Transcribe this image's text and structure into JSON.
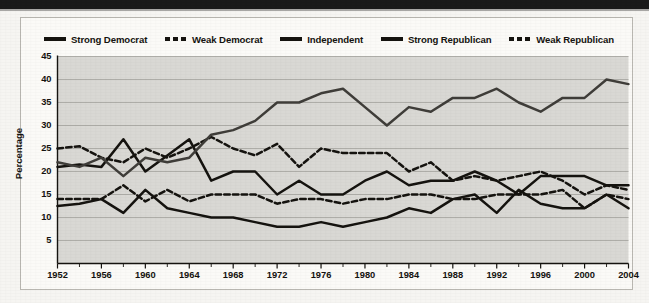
{
  "figure": {
    "y_axis_title": "Percentage"
  },
  "legend": {
    "items": [
      {
        "label": "Strong Democrat",
        "style": "solid",
        "color": "#15130f"
      },
      {
        "label": "Weak Democrat",
        "style": "dashed",
        "color": "#15130f"
      },
      {
        "label": "Independent",
        "style": "solid",
        "color": "#15130f"
      },
      {
        "label": "Strong Republican",
        "style": "solid",
        "color": "#15130f"
      },
      {
        "label": "Weak Republican",
        "style": "dashed",
        "color": "#15130f"
      }
    ]
  },
  "axes": {
    "y_ticks": [
      "45",
      "40",
      "35",
      "30",
      "25",
      "20",
      "15",
      "10",
      "5"
    ],
    "x_ticks": [
      "1952",
      "1956",
      "1960",
      "1964",
      "1968",
      "1972",
      "1976",
      "1980",
      "1984",
      "1988",
      "1992",
      "1996",
      "2000",
      "2004"
    ]
  },
  "chart_data": {
    "type": "line",
    "title": "",
    "xlabel": "",
    "ylabel": "Percentage",
    "xlim": [
      1952,
      2004
    ],
    "ylim": [
      0,
      45
    ],
    "yticks": [
      5,
      10,
      15,
      20,
      25,
      30,
      35,
      40,
      45
    ],
    "xticks": [
      1952,
      1956,
      1960,
      1964,
      1968,
      1972,
      1976,
      1980,
      1984,
      1988,
      1992,
      1996,
      2000,
      2004
    ],
    "x_minor_tick_step": 2,
    "grid": "horizontal",
    "legend_position": "top",
    "plot_background": "#d9d8d4",
    "x": [
      1952,
      1954,
      1956,
      1958,
      1960,
      1962,
      1964,
      1966,
      1968,
      1970,
      1972,
      1974,
      1976,
      1978,
      1980,
      1982,
      1984,
      1986,
      1988,
      1990,
      1992,
      1994,
      1996,
      1998,
      2000,
      2002,
      2004
    ],
    "series": [
      {
        "name": "Strong Democrat",
        "style": "solid",
        "color": "#15130f",
        "values": [
          21,
          21.5,
          21,
          27,
          20,
          23.5,
          27,
          18,
          20,
          20,
          15,
          18,
          15,
          15,
          18,
          20,
          17,
          18,
          18,
          20,
          18,
          15,
          19,
          19,
          19,
          17,
          17
        ]
      },
      {
        "name": "Weak Democrat",
        "style": "dashed",
        "color": "#15130f",
        "values": [
          25,
          25.5,
          23,
          22,
          25,
          23,
          25,
          27.5,
          25,
          23.5,
          26,
          21,
          25,
          24,
          24,
          24,
          20,
          22,
          18,
          19,
          18,
          19,
          20,
          18,
          15,
          17,
          16
        ]
      },
      {
        "name": "Independent",
        "style": "solid",
        "color": "#3f3d39",
        "values": [
          22,
          21,
          23,
          19,
          23,
          22,
          23,
          28,
          29,
          31,
          35,
          35,
          37,
          38,
          34,
          30,
          34,
          33,
          36,
          36,
          38,
          35,
          33,
          36,
          36,
          40,
          39
        ]
      },
      {
        "name": "Strong Republican",
        "style": "solid",
        "color": "#15130f",
        "values": [
          12.5,
          13,
          14,
          11,
          16,
          12,
          11,
          10,
          10,
          9,
          8,
          8,
          9,
          8,
          9,
          10,
          12,
          11,
          14,
          15,
          11,
          16,
          13,
          12,
          12,
          15,
          12
        ]
      },
      {
        "name": "Weak Republican",
        "style": "dashed",
        "color": "#15130f",
        "values": [
          14,
          14,
          14,
          17,
          13.5,
          16,
          13.5,
          15,
          15,
          15,
          13,
          14,
          14,
          13,
          14,
          14,
          15,
          15,
          14,
          14,
          15,
          15,
          15,
          16,
          12,
          15,
          14
        ]
      }
    ]
  }
}
